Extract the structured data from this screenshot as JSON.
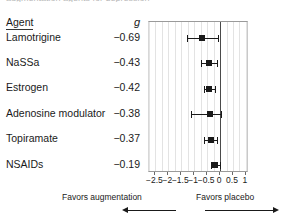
{
  "caption_sliver": "augmentation agents for depression",
  "table": {
    "header_agent": "Agent",
    "header_g": "g"
  },
  "chart_data": {
    "type": "forest",
    "title": "",
    "xlabel": "",
    "ylabel": "",
    "xlim": [
      -2.75,
      1.12
    ],
    "grid": true,
    "grid_step": 0.25,
    "zero_line": 0,
    "effect_measure": "g",
    "categories": [
      "Lamotrigine",
      "NaSSa",
      "Estrogen",
      "Adenosine modulator",
      "Topiramate",
      "NSAIDs"
    ],
    "values": [
      -0.69,
      -0.43,
      -0.42,
      -0.38,
      -0.37,
      -0.19
    ],
    "value_labels": [
      "−0.69",
      "−0.43",
      "−0.42",
      "−0.38",
      "−0.37",
      "−0.19"
    ],
    "ci_low": [
      -1.29,
      -0.73,
      -0.64,
      -1.11,
      -0.64,
      -0.37
    ],
    "ci_high": [
      -0.09,
      -0.13,
      -0.2,
      0.04,
      -0.1,
      -0.01
    ],
    "ticks": [
      -2.5,
      -2,
      -1.5,
      -1,
      -0.5,
      0,
      0.5,
      1
    ],
    "tick_labels": [
      "−2.5",
      "−2",
      "−1.5",
      "−1",
      "−0.5",
      "0",
      "0.5",
      "1"
    ],
    "annotations": {
      "left": "Favors augmentation",
      "right": "Favors placebo"
    }
  }
}
